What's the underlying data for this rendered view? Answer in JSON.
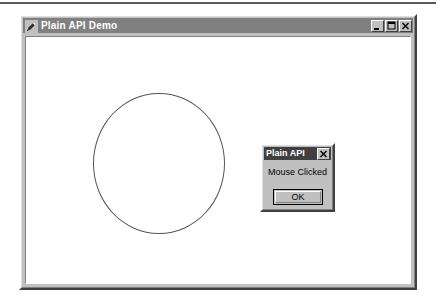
{
  "window": {
    "title": "Plain API Demo",
    "icon": "pen-icon",
    "controls": [
      {
        "name": "minimize-button",
        "glyph": "minimize-icon"
      },
      {
        "name": "maximize-button",
        "glyph": "maximize-icon"
      },
      {
        "name": "close-button",
        "glyph": "close-icon"
      }
    ]
  },
  "canvas": {
    "shape": "circle-outline",
    "stroke_color": "#555555",
    "fill_color": "#ffffff",
    "background": "#ffffff"
  },
  "dialog": {
    "title": "Plain API",
    "message": "Mouse Clicked",
    "ok_label": "OK",
    "close_glyph": "close-icon"
  },
  "colors": {
    "face": "#c0c0c0",
    "titlebar_active": "#808080",
    "dialog_titlebar": "#404040",
    "text": "#000000",
    "title_text": "#ffffff"
  }
}
